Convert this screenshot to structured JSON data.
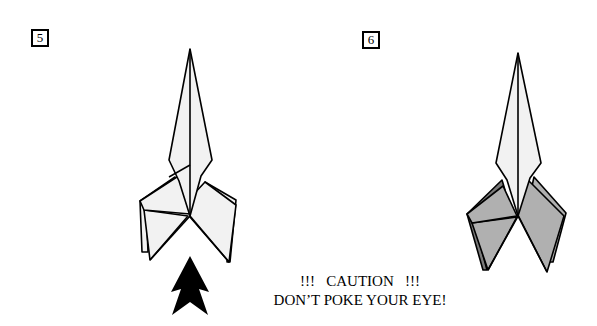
{
  "steps": [
    {
      "number": "5",
      "variant": "unshaded"
    },
    {
      "number": "6",
      "variant": "shaded"
    }
  ],
  "caution": {
    "line1": "!!!   CAUTION   !!!",
    "line2": "DON’T POKE YOUR EYE!"
  },
  "icons": {
    "arrow": "push-up-arrow-icon"
  },
  "colors": {
    "paper_light": "#f2f2f2",
    "paper_shaded": "#b0b0b0",
    "paper_dark": "#7a7a7a",
    "outline": "#000000"
  }
}
